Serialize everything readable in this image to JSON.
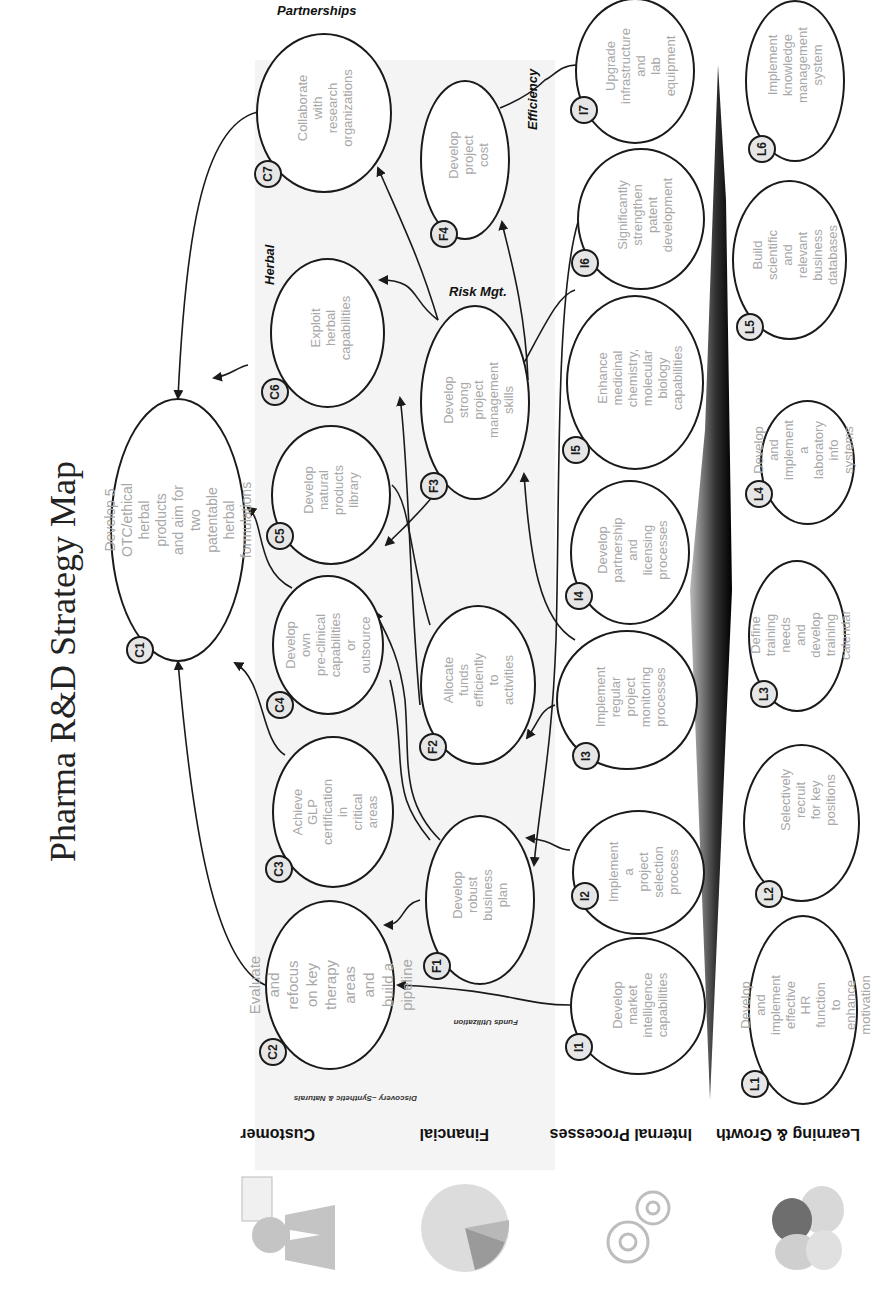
{
  "title": "Pharma R&D Strategy Map",
  "perspectives": [
    {
      "id": "customer",
      "label": "Customer",
      "icon": "customer-person-icon"
    },
    {
      "id": "financial",
      "label": "Financial",
      "icon": "pie-chart-icon"
    },
    {
      "id": "internal",
      "label": "Internal Processes",
      "icon": "gears-icon"
    },
    {
      "id": "learning",
      "label": "Learning & Growth",
      "icon": "eggs-icon"
    }
  ],
  "themes": {
    "partnerships": "Partnerships",
    "efficiency": "Efficiency",
    "herbal": "Herbal",
    "risk": "Risk Mgt.",
    "funds": "Funds Utilization",
    "discovery": "Discovery –Synthetic & Naturals"
  },
  "objectives": {
    "C1": {
      "code": "C1",
      "text": "Develop 5 OTC/ethical herbal\nproducts and aim for two patentable\nherbal  formulations"
    },
    "C2": {
      "code": "C2",
      "text": "Evaluate and\nrefocus on key\ntherapy areas and\nbuild a pipeline"
    },
    "C3": {
      "code": "C3",
      "text": "Achieve GLP\ncertification in\ncritical areas"
    },
    "C4": {
      "code": "C4",
      "text": "Develop own\npre-clinical\ncapabilities or\noutsource"
    },
    "C5": {
      "code": "C5",
      "text": "Develop\nnatural\nproducts\nlibrary"
    },
    "C6": {
      "code": "C6",
      "text": "Exploit herbal\ncapabilities"
    },
    "C7": {
      "code": "C7",
      "text": "Collaborate with\nresearch\norganizations"
    },
    "F1": {
      "code": "F1",
      "text": "Develop robust\nbusiness plan"
    },
    "F2": {
      "code": "F2",
      "text": "Allocate funds\nefficiently to\nactivities"
    },
    "F3": {
      "code": "F3",
      "text": "Develop strong\nproject management\nskills"
    },
    "F4": {
      "code": "F4",
      "text": "Develop project\ncost"
    },
    "I1": {
      "code": "I1",
      "text": "Develop\nmarket\nintelligence\ncapabilities"
    },
    "I2": {
      "code": "I2",
      "text": "Implement a\nproject\nselection\nprocess"
    },
    "I3": {
      "code": "I3",
      "text": "Implement\nregular project\nmonitoring\nprocesses"
    },
    "I4": {
      "code": "I4",
      "text": "Develop\npartnership and\nlicensing\nprocesses"
    },
    "I5": {
      "code": "I5",
      "text": "Enhance medicinal\nchemistry,\nmolecular biology\ncapabilities"
    },
    "I6": {
      "code": "I6",
      "text": "Significantly\nstrengthen\npatent\ndevelopment"
    },
    "I7": {
      "code": "I7",
      "text": "Upgrade\ninfrastructure and\nlab equipment"
    },
    "L1": {
      "code": "L1",
      "text": "Develop and\nimplement effective\nHR function to\nenhance motivation"
    },
    "L2": {
      "code": "L2",
      "text": "Selectively recruit\nfor key positions"
    },
    "L3": {
      "code": "L3",
      "text": "Define training\nneeds and develop\ntraining calendar"
    },
    "L4": {
      "code": "L4",
      "text": "Develop and\nimplement a\nlaboratory info\nsystems"
    },
    "L5": {
      "code": "L5",
      "text": "Build scientific and\nrelevant business\ndatabases"
    },
    "L6": {
      "code": "L6",
      "text": "Implement\nknowledge\nmanagement\nsystem"
    }
  },
  "colors": {
    "outline": "#1a1a1a",
    "objective_text": "#a8a8a8",
    "badge_fill": "#e6e6e6",
    "band_fill": "#f4f4f4"
  }
}
